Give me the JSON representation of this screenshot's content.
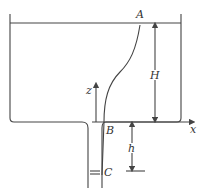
{
  "diagram": {
    "type": "tank-with-drain-pipe",
    "labels": {
      "A": "A",
      "B": "B",
      "C": "C",
      "H": "H",
      "h": "h",
      "x": "x",
      "z": "z"
    },
    "colors": {
      "stroke": "#444444",
      "background": "#ffffff"
    }
  }
}
